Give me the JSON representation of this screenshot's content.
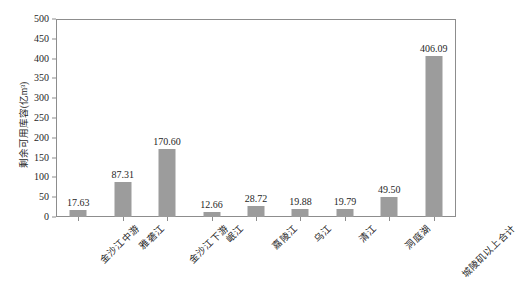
{
  "chart_data": {
    "type": "bar",
    "title": "",
    "xlabel": "",
    "ylabel": "剩余可用库容(亿m³)",
    "ylim": [
      0,
      500
    ],
    "ytick_step": 50,
    "grid": false,
    "legend": "none",
    "bar_color": "#9c9c9c",
    "frame_color": "#8d8d8d",
    "categories": [
      "金沙江中游",
      "雅砻江",
      "金沙江下游",
      "岷江",
      "嘉陵江",
      "乌江",
      "清江",
      "洞庭湖",
      "城陵矶以上合计"
    ],
    "values": [
      17.63,
      87.31,
      170.6,
      12.66,
      28.72,
      19.88,
      19.79,
      49.5,
      406.09
    ],
    "value_labels": [
      "17.63",
      "87.31",
      "170.60",
      "12.66",
      "28.72",
      "19.88",
      "19.79",
      "49.50",
      "406.09"
    ],
    "yticks": [
      0,
      50,
      100,
      150,
      200,
      250,
      300,
      350,
      400,
      450,
      500
    ],
    "ytick_labels": [
      "0",
      "50",
      "100",
      "150",
      "200",
      "250",
      "300",
      "350",
      "400",
      "450",
      "500"
    ]
  }
}
